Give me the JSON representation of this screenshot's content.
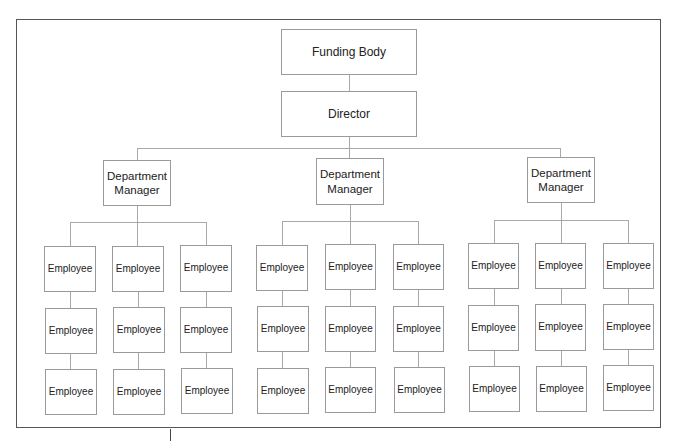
{
  "diagram": {
    "type": "org-chart",
    "root": {
      "label": "Funding Body",
      "child": {
        "label": "Director",
        "departments": [
          {
            "label": "Department Manager",
            "columns": [
              [
                "Employee",
                "Employee",
                "Employee"
              ],
              [
                "Employee",
                "Employee",
                "Employee"
              ],
              [
                "Employee",
                "Employee",
                "Employee"
              ]
            ]
          },
          {
            "label": "Department Manager",
            "columns": [
              [
                "Employee",
                "Employee",
                "Employee"
              ],
              [
                "Employee",
                "Employee",
                "Employee"
              ],
              [
                "Employee",
                "Employee",
                "Employee"
              ]
            ]
          },
          {
            "label": "Department Manager",
            "columns": [
              [
                "Employee",
                "Employee",
                "Employee"
              ],
              [
                "Employee",
                "Employee",
                "Employee"
              ],
              [
                "Employee",
                "Employee",
                "Employee"
              ]
            ]
          }
        ]
      }
    },
    "colors": {
      "frame": "#555555",
      "box_border": "#9a9a9a",
      "connector": "#a8a8a8",
      "text": "#222222",
      "background": "#ffffff"
    }
  }
}
